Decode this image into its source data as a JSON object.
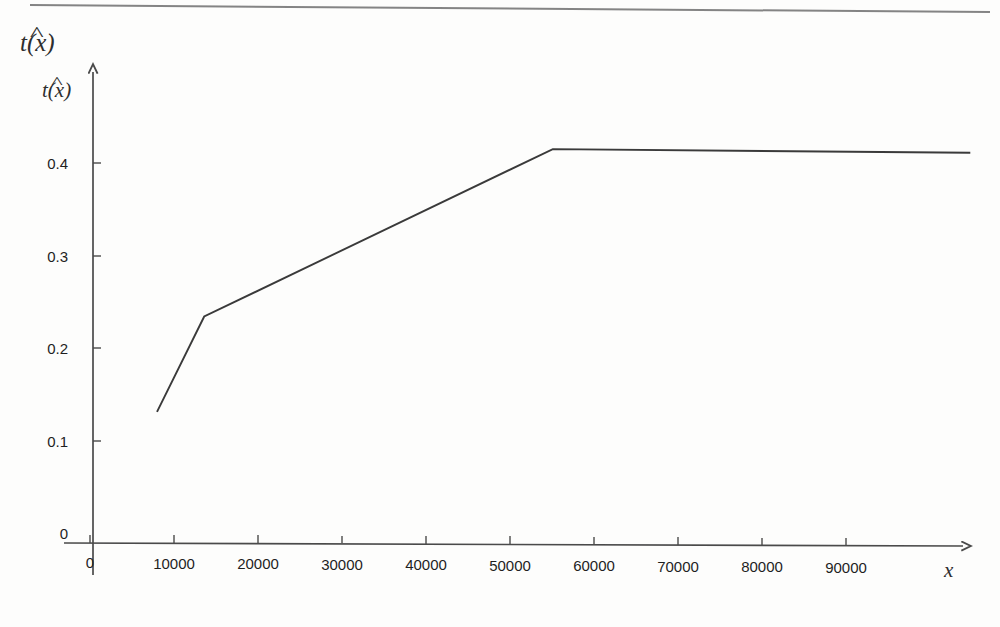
{
  "figure": {
    "title_label": "t(x)",
    "title_hat": "^",
    "ylabel": "t(x)",
    "ylabel_hat": "^",
    "xlabel": "x",
    "top_rule": "horizontal-rule",
    "line_color": "#3a3a3a",
    "axis_color": "#4a4a4a",
    "background_color": "#fdfdfc"
  },
  "chart_data": {
    "type": "line",
    "title": "t(x)",
    "xlabel": "x",
    "ylabel": "t(x)",
    "xlim": [
      0,
      104800
    ],
    "ylim": [
      0,
      0.46
    ],
    "grid": false,
    "legend": "none",
    "xticks": [
      0,
      10000,
      20000,
      30000,
      40000,
      50000,
      60000,
      70000,
      80000,
      90000
    ],
    "xtick_labels": [
      "0",
      "10000",
      "20000",
      "30000",
      "40000",
      "50000",
      "60000",
      "70000",
      "80000",
      "90000"
    ],
    "yticks": [
      0,
      0.1,
      0.2,
      0.3,
      0.4
    ],
    "ytick_labels": [
      "0",
      "0.1",
      "0.2",
      "0.3",
      "0.4"
    ],
    "series": [
      {
        "name": "t(x)",
        "x": [
          7980,
          13600,
          55100,
          104800
        ],
        "values": [
          0.131,
          0.234,
          0.415,
          0.411
        ]
      }
    ],
    "annotations": []
  }
}
